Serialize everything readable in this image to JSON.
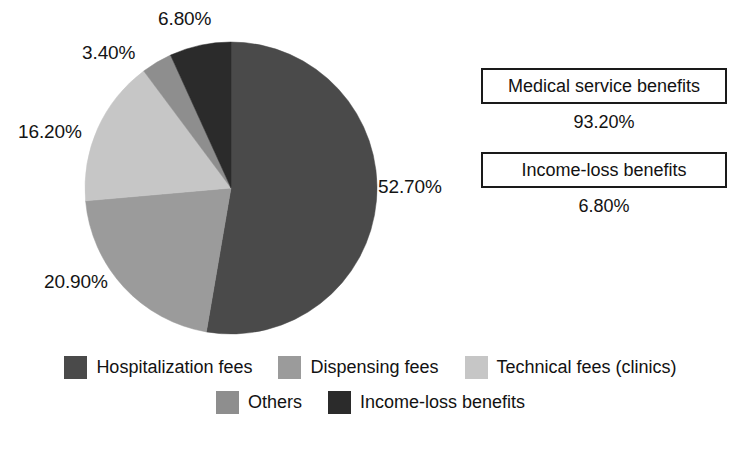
{
  "chart_data": {
    "type": "pie",
    "title": "",
    "legend_position": "bottom",
    "categories": [
      "Hospitalization fees",
      "Dispensing fees",
      "Technical fees (clinics)",
      "Others",
      "Income-loss benefits"
    ],
    "values": [
      52.7,
      20.9,
      16.2,
      3.4,
      6.8
    ],
    "value_labels": [
      "52.70%",
      "20.90%",
      "16.20%",
      "3.40%",
      "6.80%"
    ],
    "colors": [
      "#4a4a4a",
      "#9b9b9b",
      "#c6c6c6",
      "#8e8e8e",
      "#2b2b2b"
    ],
    "start_angle_deg": 0,
    "direction": "clockwise",
    "units": "percent",
    "annotations": [
      {
        "label": "Medical service benefits",
        "value": "93.20%"
      },
      {
        "label": "Income-loss benefits",
        "value": "6.80%"
      }
    ]
  },
  "pie": {
    "labels": {
      "hospitalization": "52.70%",
      "dispensing": "20.90%",
      "technical": "16.20%",
      "others": "3.40%",
      "income_loss": "6.80%"
    }
  },
  "summary": {
    "blocks": [
      {
        "label": "Medical service benefits",
        "value": "93.20%"
      },
      {
        "label": "Income-loss benefits",
        "value": "6.80%"
      }
    ]
  },
  "legend": {
    "row1": [
      {
        "label": "Hospitalization fees",
        "color": "#4a4a4a"
      },
      {
        "label": "Dispensing fees",
        "color": "#9b9b9b"
      },
      {
        "label": "Technical fees (clinics)",
        "color": "#c6c6c6"
      }
    ],
    "row2": [
      {
        "label": "Others",
        "color": "#8e8e8e"
      },
      {
        "label": "Income-loss benefits",
        "color": "#2b2b2b"
      }
    ]
  }
}
